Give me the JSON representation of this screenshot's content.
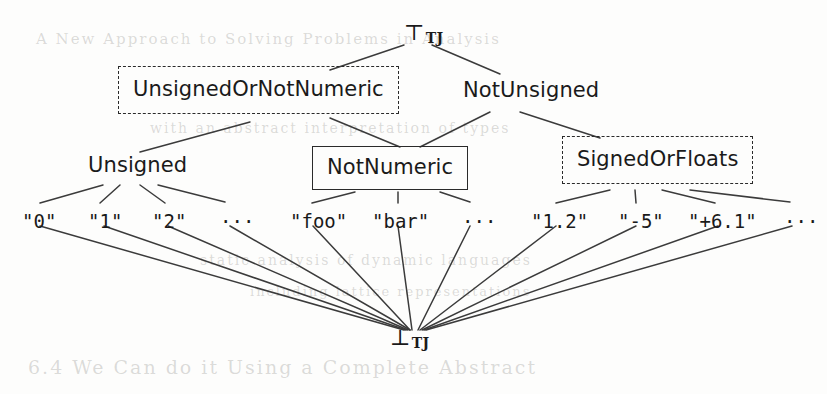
{
  "diagram": {
    "type": "lattice-hasse-diagram",
    "top_node": {
      "symbol": "⊤",
      "subscript": "TJ"
    },
    "bottom_node": {
      "symbol": "⊥",
      "subscript": "TJ"
    },
    "ellipsis": "···",
    "nodes": [
      {
        "id": "top",
        "label": "⊤",
        "subscript": "TJ",
        "style": "symbol",
        "x": 408,
        "y": 22
      },
      {
        "id": "unsignedOrNotNumeric",
        "label": "UnsignedOrNotNumeric",
        "style": "dashed-box",
        "x": 118,
        "y": 66
      },
      {
        "id": "notUnsigned",
        "label": "NotUnsigned",
        "style": "plain",
        "x": 463,
        "y": 80
      },
      {
        "id": "unsigned",
        "label": "Unsigned",
        "style": "plain",
        "x": 88,
        "y": 155
      },
      {
        "id": "notNumeric",
        "label": "NotNumeric",
        "style": "solid-box",
        "x": 312,
        "y": 146
      },
      {
        "id": "signedOrFloats",
        "label": "SignedOrFloats",
        "style": "dashed-box",
        "x": 562,
        "y": 136
      },
      {
        "id": "bottom",
        "label": "⊥",
        "subscript": "TJ",
        "style": "symbol",
        "x": 390,
        "y": 327
      }
    ],
    "literals": [
      {
        "id": "lit-0",
        "label": "\"0\"",
        "group": "unsigned",
        "x": 22,
        "y": 212
      },
      {
        "id": "lit-1",
        "label": "\"1\"",
        "group": "unsigned",
        "x": 88,
        "y": 212
      },
      {
        "id": "lit-2",
        "label": "\"2\"",
        "group": "unsigned",
        "x": 152,
        "y": 212
      },
      {
        "id": "lit-u-dots",
        "label": "···",
        "group": "unsigned",
        "x": 220,
        "y": 212
      },
      {
        "id": "lit-foo",
        "label": "\"foo\"",
        "group": "notNumeric",
        "x": 290,
        "y": 212
      },
      {
        "id": "lit-bar",
        "label": "\"bar\"",
        "group": "notNumeric",
        "x": 372,
        "y": 212
      },
      {
        "id": "lit-n-dots",
        "label": "···",
        "group": "notNumeric",
        "x": 462,
        "y": 212
      },
      {
        "id": "lit-1.2",
        "label": "\"1.2\"",
        "group": "signedOrFloats",
        "x": 531,
        "y": 212
      },
      {
        "id": "lit--5",
        "label": "\"-5\"",
        "group": "signedOrFloats",
        "x": 618,
        "y": 212
      },
      {
        "id": "lit-+6.1",
        "label": "\"+6.1\"",
        "group": "signedOrFloats",
        "x": 688,
        "y": 212
      },
      {
        "id": "lit-s-dots",
        "label": "···",
        "group": "signedOrFloats",
        "x": 784,
        "y": 212
      }
    ],
    "edges": [
      {
        "from": "top",
        "to": "unsignedOrNotNumeric",
        "x1": 404,
        "y1": 45,
        "x2": 330,
        "y2": 70
      },
      {
        "from": "top",
        "to": "notUnsigned",
        "x1": 432,
        "y1": 45,
        "x2": 500,
        "y2": 74
      },
      {
        "from": "unsignedOrNotNumeric",
        "to": "unsigned",
        "x1": 250,
        "y1": 122,
        "x2": 140,
        "y2": 152
      },
      {
        "from": "unsignedOrNotNumeric",
        "to": "notNumeric",
        "x1": 330,
        "y1": 118,
        "x2": 400,
        "y2": 147
      },
      {
        "from": "notUnsigned",
        "to": "notNumeric",
        "x1": 490,
        "y1": 112,
        "x2": 420,
        "y2": 147
      },
      {
        "from": "notUnsigned",
        "to": "signedOrFloats",
        "x1": 520,
        "y1": 112,
        "x2": 600,
        "y2": 138
      },
      {
        "from": "unsigned",
        "to": "lit-0",
        "x1": 103,
        "y1": 185,
        "x2": 40,
        "y2": 203
      },
      {
        "from": "unsigned",
        "to": "lit-1",
        "x1": 120,
        "y1": 185,
        "x2": 100,
        "y2": 203
      },
      {
        "from": "unsigned",
        "to": "lit-2",
        "x1": 140,
        "y1": 185,
        "x2": 165,
        "y2": 203
      },
      {
        "from": "unsigned",
        "to": "lit-u-dots",
        "x1": 158,
        "y1": 185,
        "x2": 225,
        "y2": 202
      },
      {
        "from": "notNumeric",
        "to": "lit-foo",
        "x1": 355,
        "y1": 192,
        "x2": 312,
        "y2": 203
      },
      {
        "from": "notNumeric",
        "to": "lit-bar",
        "x1": 398,
        "y1": 192,
        "x2": 398,
        "y2": 203
      },
      {
        "from": "notNumeric",
        "to": "lit-n-dots",
        "x1": 440,
        "y1": 192,
        "x2": 470,
        "y2": 202
      },
      {
        "from": "signedOrFloats",
        "to": "lit-1.2",
        "x1": 610,
        "y1": 190,
        "x2": 556,
        "y2": 203
      },
      {
        "from": "signedOrFloats",
        "to": "lit--5",
        "x1": 635,
        "y1": 190,
        "x2": 636,
        "y2": 203
      },
      {
        "from": "signedOrFloats",
        "to": "lit-+6.1",
        "x1": 662,
        "y1": 190,
        "x2": 715,
        "y2": 203
      },
      {
        "from": "signedOrFloats",
        "to": "lit-s-dots",
        "x1": 690,
        "y1": 190,
        "x2": 790,
        "y2": 202
      },
      {
        "from": "lit-0",
        "to": "bottom",
        "x1": 40,
        "y1": 226,
        "x2": 404,
        "y2": 330
      },
      {
        "from": "lit-1",
        "to": "bottom",
        "x1": 104,
        "y1": 226,
        "x2": 406,
        "y2": 330
      },
      {
        "from": "lit-2",
        "to": "bottom",
        "x1": 168,
        "y1": 226,
        "x2": 408,
        "y2": 330
      },
      {
        "from": "lit-u-dots",
        "to": "bottom",
        "x1": 230,
        "y1": 226,
        "x2": 410,
        "y2": 330
      },
      {
        "from": "lit-foo",
        "to": "bottom",
        "x1": 313,
        "y1": 226,
        "x2": 410,
        "y2": 330
      },
      {
        "from": "lit-bar",
        "to": "bottom",
        "x1": 398,
        "y1": 226,
        "x2": 412,
        "y2": 330
      },
      {
        "from": "lit-n-dots",
        "to": "bottom",
        "x1": 470,
        "y1": 226,
        "x2": 418,
        "y2": 330
      },
      {
        "from": "lit-1.2",
        "to": "bottom",
        "x1": 556,
        "y1": 226,
        "x2": 420,
        "y2": 330
      },
      {
        "from": "lit--5",
        "to": "bottom",
        "x1": 636,
        "y1": 226,
        "x2": 422,
        "y2": 330
      },
      {
        "from": "lit-+6.1",
        "to": "bottom",
        "x1": 718,
        "y1": 226,
        "x2": 424,
        "y2": 330
      },
      {
        "from": "lit-s-dots",
        "to": "bottom",
        "x1": 792,
        "y1": 226,
        "x2": 426,
        "y2": 330
      }
    ],
    "stroke_color": "#3b3b3b",
    "text_color": "#1a1a1a"
  }
}
